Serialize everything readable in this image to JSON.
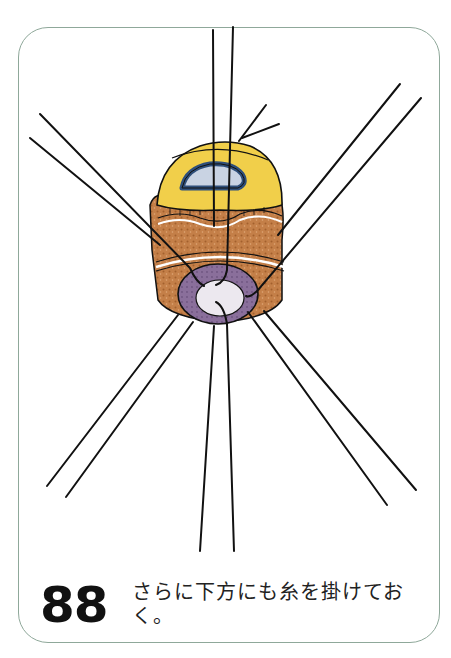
{
  "figure": {
    "step_number": "88",
    "caption": "さらに下方にも糸を掛けておく。",
    "colors": {
      "frame_border": "#8fa89a",
      "thread": "#111111",
      "yellow_layer": "#f1cf4a",
      "blue_lumen": "#2f4f7a",
      "lumen_inner": "#c9d3e3",
      "brown_tissue": "#b8733f",
      "purple_ring": "#8a6f9b",
      "center_light": "#ece8ef"
    },
    "illustration_label": "surgical-suture-illustration"
  }
}
